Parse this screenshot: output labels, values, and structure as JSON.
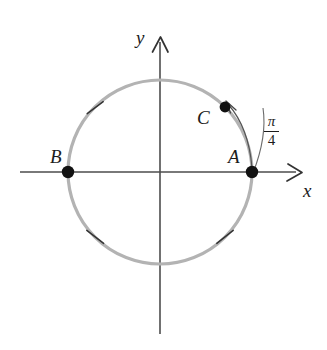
{
  "figure": {
    "background_color": "#ffffff"
  },
  "colors": {
    "circle_stroke": "#b3b3b3",
    "axis_stroke": "#4d4d4d",
    "point_fill": "#111111",
    "tick_stroke": "#333333",
    "arc_stroke": "#555555",
    "label_text": "#1c1c1c"
  },
  "geometry": {
    "center_x": 160,
    "center_y": 172,
    "radius": 92,
    "circle_stroke_width": 3.2
  },
  "axes": {
    "x_label": "x",
    "y_label": "y",
    "x_axis": {
      "x1": 20,
      "y1": 172,
      "x2": 298,
      "y2": 172
    },
    "y_axis": {
      "x1": 160,
      "y1": 332,
      "x2": 160,
      "y2": 38
    },
    "stroke_width": 1.6,
    "arrowheads": [
      "x-positive",
      "y-positive"
    ]
  },
  "points": [
    {
      "id": "A",
      "label": "A",
      "angle_deg": 0,
      "x": 252,
      "y": 172,
      "radius_px": 6.2
    },
    {
      "id": "B",
      "label": "B",
      "angle_deg": 180,
      "x": 68,
      "y": 172,
      "radius_px": 6.2
    },
    {
      "id": "C",
      "label": "C",
      "angle_deg": 45,
      "x": 225,
      "y": 107,
      "radius_px": 5.4
    }
  ],
  "tick_marks": [
    {
      "angle_deg": 135,
      "label": "tick-135"
    },
    {
      "angle_deg": 225,
      "label": "tick-225"
    },
    {
      "angle_deg": 315,
      "label": "tick-315"
    }
  ],
  "arc_arrow": {
    "from_point": "A",
    "to_point": "C",
    "direction": "counterclockwise",
    "sweep_deg": 45,
    "arrowhead_at": "C",
    "stroke_width": 1.2
  },
  "angle_annotation": {
    "numerator": "π",
    "denominator": "4",
    "display": "π/4"
  },
  "radial_line": {
    "from_point": "A",
    "description": "thin line from A outward to angle label region"
  }
}
